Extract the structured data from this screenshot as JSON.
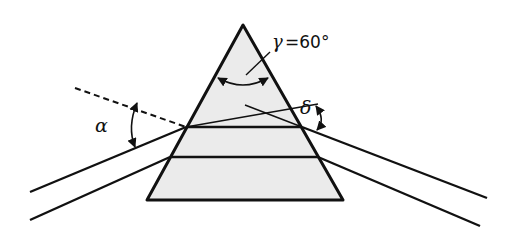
{
  "diagram": {
    "colors": {
      "stroke": "#111111",
      "prism_fill": "#ebebeb",
      "background": "#ffffff"
    },
    "prism": {
      "apex": [
        243,
        25
      ],
      "base_left": [
        147,
        200
      ],
      "base_right": [
        343,
        200
      ]
    },
    "labels": {
      "apex_angle": "γ = 60°",
      "gamma_symbol": "γ",
      "gamma_value": "=60°",
      "incidence_angle": "α",
      "deviation_angle": "δ"
    },
    "rays": {
      "upper": {
        "incoming_start": [
          30,
          192
        ],
        "entry": [
          186,
          127
        ],
        "exit": [
          302,
          127
        ],
        "outgoing_end": [
          487,
          198
        ]
      },
      "lower": {
        "incoming_start": [
          30,
          220
        ],
        "entry": [
          170,
          157
        ],
        "exit": [
          318,
          157
        ],
        "outgoing_end": [
          480,
          226
        ]
      },
      "normal_dashed": {
        "start": [
          75,
          88
        ],
        "end": [
          186,
          127
        ]
      },
      "incoming_extension": {
        "start": [
          186,
          127
        ],
        "end": [
          318,
          104
        ]
      },
      "outgoing_back_extension": {
        "start": [
          302,
          127
        ],
        "end": [
          245,
          105
        ]
      }
    }
  }
}
